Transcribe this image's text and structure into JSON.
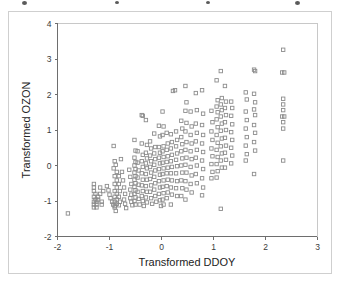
{
  "chart_data": {
    "type": "scatter",
    "title": "",
    "xlabel": "Transformed DDOY",
    "ylabel": "Transformed OZON",
    "xlim": [
      -2,
      3
    ],
    "ylim": [
      -2,
      4
    ],
    "xticks": [
      -2,
      -1,
      0,
      1,
      2,
      3
    ],
    "yticks": [
      -2,
      -1,
      0,
      1,
      2,
      3,
      4
    ],
    "xtick_labels": [
      "-2",
      "-1",
      "0",
      "1",
      "2",
      "3"
    ],
    "ytick_labels": [
      "-2",
      "-1",
      "0",
      "1",
      "2",
      "3",
      "4"
    ],
    "grid": false,
    "legend": null,
    "marker": "open-square",
    "marker_color": "#8c8c8c",
    "background_color": "#ffffff",
    "n_points": 352,
    "points": [
      [
        -1.8,
        -1.35
      ],
      [
        -1.3,
        -0.52
      ],
      [
        -1.3,
        -0.62
      ],
      [
        -1.3,
        -0.72
      ],
      [
        -1.27,
        -0.8
      ],
      [
        -1.3,
        -0.88
      ],
      [
        -1.27,
        -0.96
      ],
      [
        -1.3,
        -1.02
      ],
      [
        -1.25,
        -1.02
      ],
      [
        -1.3,
        -1.1
      ],
      [
        -1.25,
        -1.1
      ],
      [
        -1.3,
        -1.18
      ],
      [
        -1.25,
        -1.18
      ],
      [
        -1.22,
        -0.88
      ],
      [
        -1.22,
        -0.96
      ],
      [
        -1.18,
        -0.62
      ],
      [
        -1.18,
        -0.8
      ],
      [
        -1.15,
        -1.02
      ],
      [
        -1.15,
        -1.1
      ],
      [
        -1.12,
        -0.72
      ],
      [
        -1.05,
        -0.58
      ],
      [
        -1.02,
        -0.7
      ],
      [
        -1.0,
        -0.82
      ],
      [
        -0.98,
        -0.92
      ],
      [
        -0.95,
        -1.02
      ],
      [
        -0.93,
        -1.1
      ],
      [
        -0.9,
        -1.18
      ],
      [
        -0.88,
        -1.28
      ],
      [
        -0.92,
        0.55
      ],
      [
        -0.9,
        0.12
      ],
      [
        -0.88,
        0.02
      ],
      [
        -0.92,
        -0.08
      ],
      [
        -0.86,
        -0.18
      ],
      [
        -0.9,
        -0.3
      ],
      [
        -0.86,
        -0.42
      ],
      [
        -0.9,
        -0.52
      ],
      [
        -0.86,
        -0.62
      ],
      [
        -0.9,
        -0.72
      ],
      [
        -0.86,
        -0.8
      ],
      [
        -0.9,
        -0.88
      ],
      [
        -0.86,
        -0.96
      ],
      [
        -0.9,
        -1.02
      ],
      [
        -0.86,
        -1.08
      ],
      [
        -0.9,
        -1.14
      ],
      [
        -0.82,
        -0.3
      ],
      [
        -0.82,
        -0.52
      ],
      [
        -0.8,
        -0.72
      ],
      [
        -0.82,
        -0.88
      ],
      [
        -0.8,
        -1.02
      ],
      [
        -0.82,
        -1.12
      ],
      [
        -0.78,
        0.18
      ],
      [
        -0.76,
        -0.18
      ],
      [
        -0.74,
        -0.42
      ],
      [
        -0.72,
        -0.62
      ],
      [
        -0.7,
        -0.8
      ],
      [
        -0.72,
        -0.96
      ],
      [
        -0.7,
        -1.08
      ],
      [
        -0.68,
        -1.2
      ],
      [
        -0.62,
        -0.12
      ],
      [
        -0.6,
        -0.32
      ],
      [
        -0.58,
        -0.52
      ],
      [
        -0.6,
        -0.68
      ],
      [
        -0.58,
        -0.82
      ],
      [
        -0.6,
        -0.92
      ],
      [
        -0.58,
        -1.02
      ],
      [
        -0.56,
        -1.12
      ],
      [
        -0.52,
        0.72
      ],
      [
        -0.5,
        0.42
      ],
      [
        -0.52,
        0.22
      ],
      [
        -0.5,
        0.1
      ],
      [
        -0.52,
        0.0
      ],
      [
        -0.5,
        -0.1
      ],
      [
        -0.52,
        -0.2
      ],
      [
        -0.5,
        -0.3
      ],
      [
        -0.52,
        -0.4
      ],
      [
        -0.5,
        -0.5
      ],
      [
        -0.52,
        -0.6
      ],
      [
        -0.5,
        -0.7
      ],
      [
        -0.52,
        -0.8
      ],
      [
        -0.5,
        -0.9
      ],
      [
        -0.52,
        -1.0
      ],
      [
        -0.5,
        -1.1
      ],
      [
        -0.46,
        0.4
      ],
      [
        -0.46,
        0.08
      ],
      [
        -0.44,
        -0.14
      ],
      [
        -0.46,
        -0.34
      ],
      [
        -0.44,
        -0.54
      ],
      [
        -0.46,
        -0.74
      ],
      [
        -0.44,
        -0.94
      ],
      [
        -0.42,
        -1.1
      ],
      [
        -0.38,
        1.42
      ],
      [
        -0.36,
        1.4
      ],
      [
        -0.38,
        0.62
      ],
      [
        -0.36,
        0.3
      ],
      [
        -0.38,
        0.12
      ],
      [
        -0.36,
        -0.04
      ],
      [
        -0.38,
        -0.22
      ],
      [
        -0.36,
        -0.4
      ],
      [
        -0.38,
        -0.56
      ],
      [
        -0.36,
        -0.72
      ],
      [
        -0.38,
        -0.86
      ],
      [
        -0.36,
        -1.0
      ],
      [
        -0.34,
        -1.14
      ],
      [
        -0.3,
        1.28
      ],
      [
        -0.28,
        0.58
      ],
      [
        -0.3,
        0.36
      ],
      [
        -0.28,
        0.2
      ],
      [
        -0.3,
        0.06
      ],
      [
        -0.28,
        -0.08
      ],
      [
        -0.3,
        -0.24
      ],
      [
        -0.28,
        -0.4
      ],
      [
        -0.3,
        -0.58
      ],
      [
        -0.28,
        -0.74
      ],
      [
        -0.3,
        -0.9
      ],
      [
        -0.28,
        -1.04
      ],
      [
        -0.22,
        0.68
      ],
      [
        -0.2,
        0.48
      ],
      [
        -0.22,
        0.28
      ],
      [
        -0.2,
        0.12
      ],
      [
        -0.22,
        -0.04
      ],
      [
        -0.2,
        -0.2
      ],
      [
        -0.22,
        -0.38
      ],
      [
        -0.2,
        -0.56
      ],
      [
        -0.22,
        -0.74
      ],
      [
        -0.2,
        -0.92
      ],
      [
        -0.18,
        -1.08
      ],
      [
        -0.14,
        0.9
      ],
      [
        -0.12,
        0.52
      ],
      [
        -0.14,
        0.34
      ],
      [
        -0.12,
        0.18
      ],
      [
        -0.14,
        0.02
      ],
      [
        -0.12,
        -0.14
      ],
      [
        -0.14,
        -0.32
      ],
      [
        -0.12,
        -0.5
      ],
      [
        -0.14,
        -0.68
      ],
      [
        -0.12,
        -0.86
      ],
      [
        -0.1,
        -1.02
      ],
      [
        -0.05,
        1.12
      ],
      [
        -0.03,
        0.82
      ],
      [
        -0.05,
        0.52
      ],
      [
        -0.03,
        0.36
      ],
      [
        -0.05,
        0.22
      ],
      [
        -0.03,
        0.06
      ],
      [
        -0.05,
        -0.1
      ],
      [
        -0.03,
        -0.26
      ],
      [
        -0.05,
        -0.44
      ],
      [
        -0.03,
        -0.62
      ],
      [
        -0.05,
        -0.8
      ],
      [
        -0.03,
        -0.98
      ],
      [
        -0.01,
        -1.14
      ],
      [
        0.02,
        1.52
      ],
      [
        0.04,
        1.1
      ],
      [
        0.02,
        0.86
      ],
      [
        0.04,
        0.54
      ],
      [
        0.02,
        0.4
      ],
      [
        0.04,
        0.24
      ],
      [
        0.02,
        0.08
      ],
      [
        0.04,
        -0.08
      ],
      [
        0.02,
        -0.24
      ],
      [
        0.04,
        -0.42
      ],
      [
        0.02,
        -0.6
      ],
      [
        0.04,
        -0.78
      ],
      [
        0.02,
        -0.96
      ],
      [
        0.04,
        -1.1
      ],
      [
        0.1,
        0.92
      ],
      [
        0.12,
        0.62
      ],
      [
        0.1,
        0.44
      ],
      [
        0.12,
        0.26
      ],
      [
        0.1,
        0.1
      ],
      [
        0.12,
        -0.06
      ],
      [
        0.1,
        -0.22
      ],
      [
        0.12,
        -0.4
      ],
      [
        0.1,
        -0.58
      ],
      [
        0.12,
        -0.76
      ],
      [
        0.1,
        -0.92
      ],
      [
        0.18,
        0.88
      ],
      [
        0.2,
        0.66
      ],
      [
        0.18,
        0.48
      ],
      [
        0.2,
        0.3
      ],
      [
        0.18,
        0.12
      ],
      [
        0.2,
        -0.04
      ],
      [
        0.18,
        -0.22
      ],
      [
        0.2,
        -0.42
      ],
      [
        0.18,
        -0.62
      ],
      [
        0.2,
        -0.82
      ],
      [
        0.18,
        -1.1
      ],
      [
        0.22,
        2.1
      ],
      [
        0.26,
        2.12
      ],
      [
        0.28,
        0.96
      ],
      [
        0.3,
        0.72
      ],
      [
        0.28,
        0.54
      ],
      [
        0.3,
        0.34
      ],
      [
        0.28,
        0.16
      ],
      [
        0.3,
        -0.02
      ],
      [
        0.28,
        -0.22
      ],
      [
        0.3,
        -0.44
      ],
      [
        0.28,
        -0.64
      ],
      [
        0.3,
        -0.86
      ],
      [
        0.38,
        1.26
      ],
      [
        0.4,
        1.04
      ],
      [
        0.38,
        0.8
      ],
      [
        0.4,
        0.6
      ],
      [
        0.38,
        0.4
      ],
      [
        0.4,
        0.2
      ],
      [
        0.38,
        0.0
      ],
      [
        0.4,
        -0.2
      ],
      [
        0.38,
        -0.42
      ],
      [
        0.4,
        -0.64
      ],
      [
        0.38,
        -0.86
      ],
      [
        0.46,
        2.24
      ],
      [
        0.48,
        1.78
      ],
      [
        0.46,
        1.54
      ],
      [
        0.48,
        1.2
      ],
      [
        0.46,
        0.96
      ],
      [
        0.48,
        0.66
      ],
      [
        0.46,
        0.44
      ],
      [
        0.48,
        0.22
      ],
      [
        0.46,
        0.02
      ],
      [
        0.48,
        -0.2
      ],
      [
        0.46,
        -0.44
      ],
      [
        0.48,
        -0.68
      ],
      [
        0.46,
        -0.96
      ],
      [
        0.56,
        1.52
      ],
      [
        0.58,
        1.1
      ],
      [
        0.56,
        0.86
      ],
      [
        0.58,
        0.62
      ],
      [
        0.56,
        0.4
      ],
      [
        0.58,
        0.18
      ],
      [
        0.56,
        -0.04
      ],
      [
        0.58,
        -0.28
      ],
      [
        0.56,
        -0.52
      ],
      [
        0.58,
        -0.76
      ],
      [
        0.66,
        2.04
      ],
      [
        0.68,
        1.56
      ],
      [
        0.66,
        1.18
      ],
      [
        0.68,
        0.92
      ],
      [
        0.66,
        0.68
      ],
      [
        0.68,
        0.44
      ],
      [
        0.66,
        0.22
      ],
      [
        0.68,
        0.0
      ],
      [
        0.66,
        -0.24
      ],
      [
        0.68,
        -0.5
      ],
      [
        0.78,
        2.12
      ],
      [
        0.8,
        1.46
      ],
      [
        0.78,
        1.14
      ],
      [
        0.8,
        0.86
      ],
      [
        0.78,
        0.62
      ],
      [
        0.8,
        0.38
      ],
      [
        0.78,
        0.14
      ],
      [
        0.8,
        -0.1
      ],
      [
        0.78,
        -0.36
      ],
      [
        0.8,
        -0.62
      ],
      [
        0.78,
        -0.84
      ],
      [
        0.96,
        1.54
      ],
      [
        0.98,
        1.22
      ],
      [
        0.96,
        0.96
      ],
      [
        0.98,
        0.72
      ],
      [
        0.96,
        0.48
      ],
      [
        0.98,
        0.26
      ],
      [
        0.96,
        0.04
      ],
      [
        0.98,
        -0.18
      ],
      [
        0.96,
        -0.36
      ],
      [
        1.06,
        2.4
      ],
      [
        1.08,
        1.84
      ],
      [
        1.06,
        1.66
      ],
      [
        1.08,
        1.5
      ],
      [
        1.06,
        1.3
      ],
      [
        1.08,
        1.08
      ],
      [
        1.06,
        0.86
      ],
      [
        1.08,
        0.64
      ],
      [
        1.06,
        0.44
      ],
      [
        1.08,
        0.24
      ],
      [
        1.06,
        0.04
      ],
      [
        1.08,
        -0.16
      ],
      [
        1.06,
        -0.34
      ],
      [
        1.14,
        2.66
      ],
      [
        1.16,
        1.9
      ],
      [
        1.14,
        1.72
      ],
      [
        1.16,
        1.56
      ],
      [
        1.14,
        1.38
      ],
      [
        1.16,
        1.18
      ],
      [
        1.14,
        0.98
      ],
      [
        1.16,
        0.76
      ],
      [
        1.14,
        0.54
      ],
      [
        1.16,
        0.34
      ],
      [
        1.14,
        0.14
      ],
      [
        1.16,
        -0.06
      ],
      [
        1.14,
        -1.22
      ],
      [
        1.22,
        2.24
      ],
      [
        1.24,
        1.8
      ],
      [
        1.22,
        1.62
      ],
      [
        1.24,
        1.42
      ],
      [
        1.22,
        1.22
      ],
      [
        1.24,
        1.0
      ],
      [
        1.22,
        0.78
      ],
      [
        1.24,
        0.56
      ],
      [
        1.22,
        0.36
      ],
      [
        1.24,
        0.16
      ],
      [
        1.22,
        -0.06
      ],
      [
        1.34,
        1.8
      ],
      [
        1.36,
        1.62
      ],
      [
        1.34,
        1.4
      ],
      [
        1.36,
        1.16
      ],
      [
        1.34,
        0.94
      ],
      [
        1.36,
        0.72
      ],
      [
        1.34,
        0.5
      ],
      [
        1.36,
        0.28
      ],
      [
        1.34,
        0.06
      ],
      [
        1.62,
        2.06
      ],
      [
        1.64,
        1.86
      ],
      [
        1.62,
        1.52
      ],
      [
        1.64,
        1.28
      ],
      [
        1.62,
        1.04
      ],
      [
        1.64,
        0.8
      ],
      [
        1.62,
        0.56
      ],
      [
        1.64,
        0.32
      ],
      [
        1.62,
        0.14
      ],
      [
        1.78,
        2.7
      ],
      [
        1.8,
        2.66
      ],
      [
        1.78,
        2.02
      ],
      [
        1.8,
        1.78
      ],
      [
        1.78,
        1.58
      ],
      [
        1.8,
        1.42
      ],
      [
        1.78,
        1.14
      ],
      [
        1.8,
        0.92
      ],
      [
        1.78,
        0.66
      ],
      [
        1.8,
        0.42
      ],
      [
        1.78,
        -0.24
      ],
      [
        2.34,
        3.26
      ],
      [
        2.32,
        2.62
      ],
      [
        2.36,
        2.62
      ],
      [
        2.34,
        1.88
      ],
      [
        2.34,
        1.72
      ],
      [
        2.34,
        1.56
      ],
      [
        2.32,
        1.38
      ],
      [
        2.36,
        1.38
      ],
      [
        2.34,
        1.22
      ],
      [
        2.34,
        1.04
      ],
      [
        2.34,
        0.14
      ]
    ]
  },
  "axes": {
    "x_title": "Transformed DDOY",
    "y_title": "Transformed OZON"
  }
}
